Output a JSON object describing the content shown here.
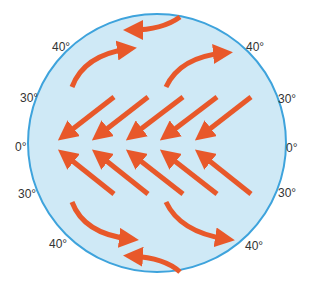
{
  "diagram": {
    "globe_fill": "#cfe9f6",
    "globe_stroke": "#3ea3dc",
    "arrow_color": "#e8582a",
    "latitude_labels": {
      "left": [
        "40°",
        "30°",
        "0°",
        "30°",
        "40°"
      ],
      "right": [
        "40°",
        "30°",
        "0°",
        "30°",
        "40°"
      ]
    },
    "wind_bands": [
      {
        "name": "polar-easterlies-north",
        "direction": "east-to-west"
      },
      {
        "name": "westerlies-north",
        "direction": "west-to-east"
      },
      {
        "name": "trade-winds-north",
        "direction": "northeast-to-southwest",
        "count": 5
      },
      {
        "name": "trade-winds-south",
        "direction": "southeast-to-northwest",
        "count": 5
      },
      {
        "name": "westerlies-south",
        "direction": "west-to-east"
      },
      {
        "name": "polar-easterlies-south",
        "direction": "east-to-west"
      }
    ]
  }
}
